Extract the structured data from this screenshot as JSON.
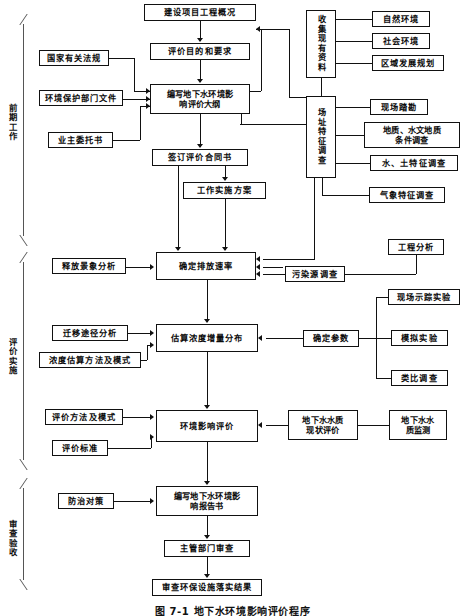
{
  "figure": {
    "caption": "图 7-1  地下水环境影响评价程序",
    "phases": [
      {
        "name": "preliminary-work",
        "label": "前期工作"
      },
      {
        "name": "evaluation-implementation",
        "label": "评价实施"
      },
      {
        "name": "review-acceptance",
        "label": "审查验收"
      }
    ]
  },
  "nodes": {
    "project_overview": "建设项目工程概况",
    "purpose_requirements": "评价目的和要求",
    "outline": "编写地下水环境影\n响评价大纲",
    "national_regulations": "国家有关法规",
    "epa_documents": "环境保护部门文件",
    "owner_commission": "业主委托书",
    "sign_contract": "签订评价合同书",
    "work_plan": "工作实施方案",
    "collect_data": "收集现有资料",
    "natural_env": "自然环境",
    "social_env": "社会环境",
    "regional_plan": "区域发展规划",
    "site_survey": "场址特征调查",
    "field_recon": "现场踏勘",
    "geology_hydro": "地质、水文地质\n条件调查",
    "water_soil": "水、土特征调查",
    "meteorology": "气象特征调查",
    "release_scenario": "释放景象分析",
    "discharge_rate": "确定排放速率",
    "engineering_analysis": "工程分析",
    "pollution_source": "污染源调查",
    "migration_path": "迁移途径分析",
    "concentration_method": "浓度估算方法及模式",
    "estimate_concentration": "估算浓度增量分布",
    "determine_params": "确定参数",
    "tracer_experiment": "现场示踪实验",
    "simulation_experiment": "模拟实验",
    "analogy_survey": "类比调查",
    "eval_method": "评价方法及模式",
    "eval_standard": "评价标准",
    "env_impact_eval": "环境影响评价",
    "groundwater_quality_eval": "地下水水质\n现状评价",
    "groundwater_quality_monitor": "地下水水\n质监测",
    "prevention_measures": "防治对策",
    "write_report": "编写地下水环境影\n响报告书",
    "authority_review": "主管部门审查",
    "facility_check": "审查环保设施落实结果"
  }
}
